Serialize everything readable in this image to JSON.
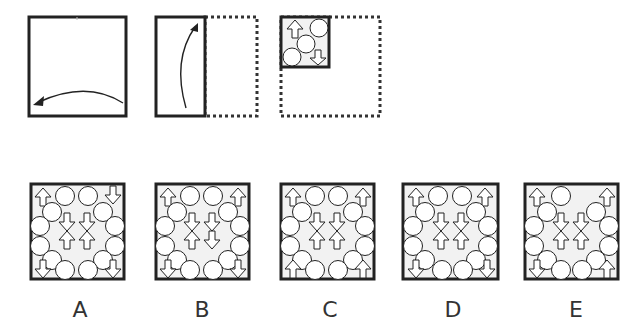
{
  "puzzle": {
    "type": "paper-folding",
    "steps": [
      {
        "id": "step-1",
        "description": "Square paper folded right-to-left along vertical midline",
        "fold_arrow": "curved-left"
      },
      {
        "id": "step-2",
        "description": "Half-rectangle folded bottom-to-top along horizontal midline",
        "fold_arrow": "curved-up"
      },
      {
        "id": "step-3",
        "description": "Quarter square with pattern: up-arrow top-left, circle top-right, circle center, circle bottom-left, down-arrow bottom-right"
      }
    ],
    "options": [
      {
        "label": "A"
      },
      {
        "label": "B"
      },
      {
        "label": "C"
      },
      {
        "label": "D"
      },
      {
        "label": "E"
      }
    ]
  },
  "colors": {
    "stroke": "#222222",
    "fill": "#f2f2f2",
    "dotted": "#333333",
    "label": "#333333"
  }
}
